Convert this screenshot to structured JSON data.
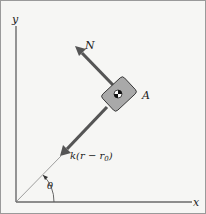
{
  "diagram": {
    "axes": {
      "x_label": "x",
      "y_label": "y"
    },
    "angle_label": "θ",
    "block_label": "A",
    "normal_force_label": "N",
    "spring_force": {
      "k": "k",
      "open": "(r − r",
      "sub": "0",
      "close": ")"
    },
    "colors": {
      "background": "#f6f6f4",
      "axis": "#666666",
      "force_arrow": "#555555",
      "block_fill": "#a9a9a9",
      "block_stroke": "#333333"
    }
  }
}
